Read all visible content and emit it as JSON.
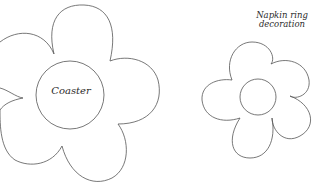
{
  "diagram": {
    "shapes": [
      {
        "id": "coaster",
        "label": "Coaster",
        "type": "five-petal flower with center circle"
      },
      {
        "id": "napkin-ring-decoration",
        "label_line1": "Napkin ring",
        "label_line2": "decoration",
        "type": "five-petal flower with center circle"
      }
    ],
    "colors": {
      "background": "#ffffff",
      "stroke": "#555555",
      "text": "#2b2b2b"
    }
  }
}
